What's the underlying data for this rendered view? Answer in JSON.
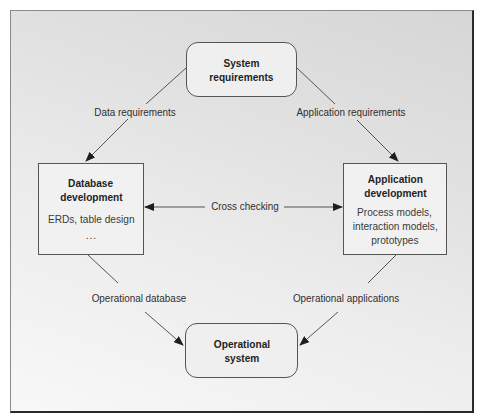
{
  "diagram": {
    "type": "flow",
    "nodes": {
      "system_requirements": {
        "title_line1": "System",
        "title_line2": "requirements",
        "shape": "rounded-rect"
      },
      "database_development": {
        "title_line1": "Database",
        "title_line2": "development",
        "body_line1": "ERDs, table design",
        "body_line2": "...",
        "shape": "rect"
      },
      "application_development": {
        "title_line1": "Application",
        "title_line2": "development",
        "body_line1": "Process models,",
        "body_line2": "interaction models,",
        "body_line3": "prototypes",
        "shape": "rect"
      },
      "operational_system": {
        "title_line1": "Operational",
        "title_line2": "system",
        "shape": "rounded-rect"
      }
    },
    "edges": {
      "data_requirements": {
        "label": "Data requirements",
        "from": "System requirements",
        "to": "Database development"
      },
      "application_requirements": {
        "label": "Application requirements",
        "from": "System requirements",
        "to": "Application development"
      },
      "cross_checking": {
        "label": "Cross checking",
        "from": "Database development",
        "to": "Application development",
        "bidirectional": true
      },
      "operational_database": {
        "label": "Operational database",
        "from": "Database development",
        "to": "Operational system"
      },
      "operational_applications": {
        "label": "Operational applications",
        "from": "Application development",
        "to": "Operational system"
      }
    },
    "colors": {
      "frame_border": "#2a2a2a",
      "node_border": "#555555",
      "node_fill": "#f1f1f1",
      "line": "#3a3a3a",
      "text": "#2a2a2a"
    }
  }
}
